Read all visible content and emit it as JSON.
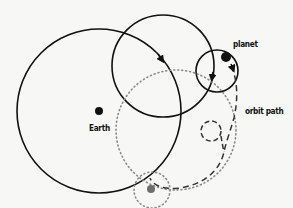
{
  "diagram": {
    "type": "epicycle-orbit",
    "labels": {
      "earth": "Earth",
      "planet": "planet",
      "orbit_path": "orbit path"
    },
    "colors": {
      "background": "#f7f7f5",
      "stroke": "#111111",
      "dotted": "#8a8a8a",
      "dashed": "#333333",
      "earth_dot": "#111111",
      "planet_dot": "#111111",
      "ghost_dot": "#6e6e6e"
    },
    "elements": {
      "earth_dot": {
        "cx": 99,
        "cy": 111,
        "r": 4
      },
      "planet_dot": {
        "cx": 226,
        "cy": 57,
        "r": 5
      },
      "ghost_dot": {
        "cx": 151,
        "cy": 189,
        "r": 4
      },
      "large_circle": {
        "cx": 99,
        "cy": 111,
        "r": 82,
        "style": "solid"
      },
      "medium_circle": {
        "cx": 163,
        "cy": 66,
        "r": 51,
        "style": "solid"
      },
      "small_circle": {
        "cx": 217,
        "cy": 71,
        "r": 21,
        "style": "solid"
      },
      "deferent_dotted": {
        "cx": 176,
        "cy": 130,
        "r": 60,
        "style": "dotted"
      },
      "epicycle_dotted": {
        "cx": 152,
        "cy": 190,
        "r": 18,
        "style": "dotted"
      },
      "loop_dashed": {
        "cx": 211,
        "cy": 132,
        "r": 10,
        "style": "dashed"
      }
    }
  }
}
